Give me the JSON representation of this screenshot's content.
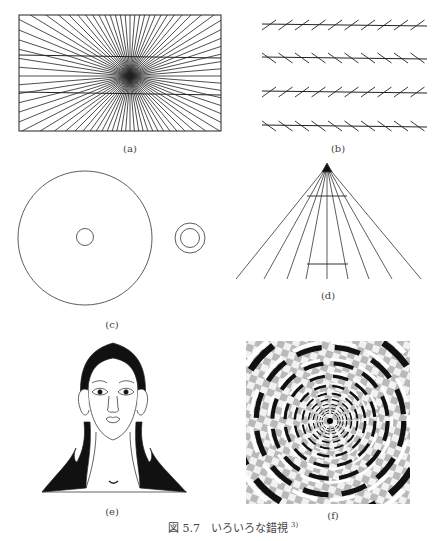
{
  "figure": {
    "number": "図 5.7",
    "title": "いろいろな錯視",
    "reference": "3)",
    "panels": [
      {
        "id": "a",
        "label": "(a)",
        "description": "Hering illusion: two parallel horizontal lines over a radiating line pattern"
      },
      {
        "id": "b",
        "label": "(b)",
        "description": "Zöllner illusion: parallel horizontal lines with alternating oblique hatches"
      },
      {
        "id": "c",
        "label": "(c)",
        "description": "Delboeuf illusion: equal small circles inside a large circle and inside a slightly larger ring"
      },
      {
        "id": "d",
        "label": "(d)",
        "description": "Ponzo illusion: two equal horizontal bars on converging lines"
      },
      {
        "id": "e",
        "label": "(e)",
        "description": "Face/figure illusion drawing (woman's face with hair shapes)"
      },
      {
        "id": "f",
        "label": "(f)",
        "description": "Fraser spiral illusion: concentric circles appearing as a spiral on a checkered background"
      }
    ]
  },
  "colors": {
    "ink": "#222222",
    "label": "#444444",
    "background": "#ffffff",
    "checker_gray": "#b8b8b8"
  }
}
